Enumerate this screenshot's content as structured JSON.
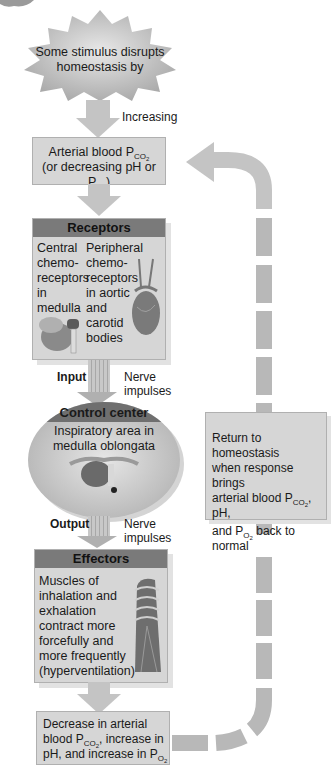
{
  "stimulus": {
    "line1": "Some stimulus disrupts",
    "line2": "homeostasis by"
  },
  "increasing_label": "Increasing",
  "controlled_condition": {
    "line1_prefix": "Arterial blood P",
    "line1_sub": "CO",
    "line1_subsub": "2",
    "line2_prefix": "(or decreasing pH or P",
    "line2_sub": "O",
    "line2_subsub": "2",
    "line2_suffix": ")"
  },
  "receptors": {
    "title": "Receptors",
    "central": [
      "Central",
      "chemo-",
      "receptors",
      "in",
      "medulla"
    ],
    "peripheral": [
      "Peripheral",
      "chemo-",
      "receptors",
      "in aortic",
      "and",
      "carotid",
      "bodies"
    ]
  },
  "input": {
    "label": "Input",
    "nerve1": "Nerve",
    "nerve2": "impulses"
  },
  "control_center": {
    "title": "Control center",
    "line1": "Inspiratory area in",
    "line2": "medulla oblongata"
  },
  "output": {
    "label": "Output",
    "nerve1": "Nerve",
    "nerve2": "impulses"
  },
  "effectors": {
    "title": "Effectors",
    "lines": [
      "Muscles of",
      "inhalation and",
      "exhalation",
      "contract more",
      "forcefully and",
      "more frequently",
      "(hyperventilation)"
    ]
  },
  "response": {
    "line1": "Decrease in arterial",
    "line2_prefix": "blood P",
    "line2_sub": "CO",
    "line2_subsub": "2",
    "line2_suffix": ", increase in",
    "line3_prefix": "pH, and increase in P",
    "line3_sub": "O",
    "line3_subsub": "2"
  },
  "return_box": {
    "line1": "Return to homeostasis",
    "line2": "when response brings",
    "line3_prefix": "arterial blood P",
    "line3_sub": "CO",
    "line3_subsub": "2",
    "line3_suffix": ", pH,",
    "line4_prefix": "and P",
    "line4_sub": "O",
    "line4_subsub": "2",
    "line4_suffix": " back to normal"
  },
  "colors": {
    "box_fill": "#d6d6d6",
    "header_fill": "#7a7a7a",
    "arrow_fill": "#c4c4c4",
    "dashed_loop": "#b8b8b8"
  }
}
